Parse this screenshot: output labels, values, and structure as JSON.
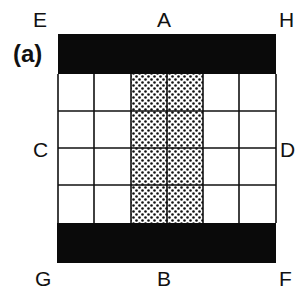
{
  "panel_label": "(a)",
  "corners": {
    "top_left": "E",
    "top_right": "H",
    "bottom_left": "G",
    "bottom_right": "F"
  },
  "midpoints": {
    "top": "A",
    "bottom": "B",
    "left": "C",
    "right": "D"
  },
  "grid": {
    "columns": 6,
    "rows": 4,
    "dotted_columns": [
      3,
      4
    ],
    "top_band": "black",
    "bottom_band": "black"
  },
  "colors": {
    "band": "#0a0a0a",
    "line": "#111111",
    "dot": "#111111",
    "cell": "#ffffff"
  }
}
